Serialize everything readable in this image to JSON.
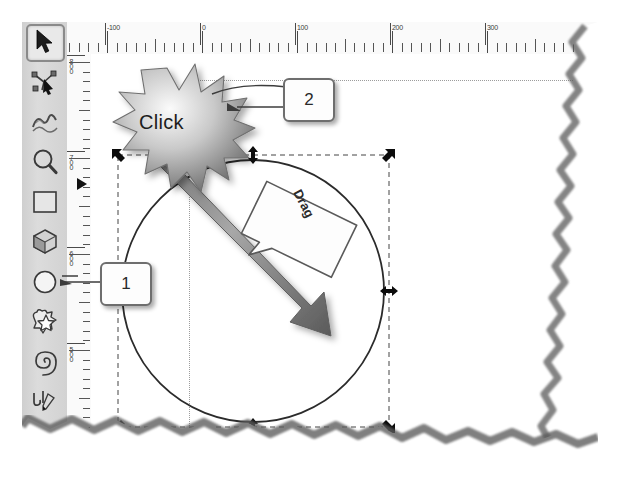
{
  "app": {
    "name": "vector-drawing-editor",
    "canvas_background": "#ffffff",
    "toolbar_background": "#d6d6d6"
  },
  "toolbar": {
    "active_tool": "selector",
    "tools": [
      {
        "id": "selector",
        "label": "Selector tool",
        "icon": "arrow-cursor-icon",
        "active": true
      },
      {
        "id": "node",
        "label": "Node editor tool",
        "icon": "node-edit-icon",
        "active": false
      },
      {
        "id": "tweak",
        "label": "Tweak tool",
        "icon": "wave-tweak-icon",
        "active": false
      },
      {
        "id": "zoom",
        "label": "Zoom tool",
        "icon": "magnifier-icon",
        "active": false
      },
      {
        "id": "rectangle",
        "label": "Rectangle tool",
        "icon": "square-icon",
        "active": false
      },
      {
        "id": "box3d",
        "label": "3D box tool",
        "icon": "cube-icon",
        "active": false
      },
      {
        "id": "ellipse",
        "label": "Ellipse / circle tool",
        "icon": "circle-icon",
        "active": false
      },
      {
        "id": "star",
        "label": "Star tool",
        "icon": "star-icon",
        "active": false
      },
      {
        "id": "spiral",
        "label": "Spiral tool",
        "icon": "spiral-icon",
        "active": false
      },
      {
        "id": "pencil",
        "label": "Pencil tool",
        "icon": "pencil-icon",
        "active": false
      },
      {
        "id": "calligraphy",
        "label": "Calligraphy tool",
        "icon": "calligraphy-pen-icon",
        "active": false
      }
    ]
  },
  "rulers": {
    "units": "px",
    "horizontal": {
      "labels": [
        "-100",
        "0",
        "100",
        "200",
        "300"
      ],
      "positions": [
        38,
        133,
        228,
        323,
        418
      ]
    },
    "vertical": {
      "labels": [
        "800",
        "700",
        "600",
        "500"
      ],
      "positions": [
        4,
        100,
        196,
        292
      ]
    }
  },
  "annotations": {
    "callouts": [
      {
        "number": "1",
        "points_to": "ellipse-tool"
      },
      {
        "number": "2",
        "points_to": "circle-top-handle"
      }
    ],
    "click_label": "Click",
    "drag_label": "Drag"
  },
  "selection": {
    "shape": "circle",
    "handles": [
      "nw",
      "n",
      "ne",
      "w",
      "e",
      "sw",
      "s",
      "se"
    ],
    "handle_style": "arrow",
    "bbox_style": "dashed"
  }
}
